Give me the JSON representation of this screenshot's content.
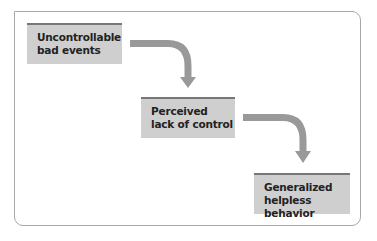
{
  "diagram": {
    "type": "flowchart",
    "colors": {
      "box_fill": "#cfcfcf",
      "box_top_border": "#777777",
      "arrow": "#999999",
      "frame": "#a8a8a8"
    },
    "nodes": [
      {
        "id": "n1",
        "line1": "Uncontrollable",
        "line2": "bad events"
      },
      {
        "id": "n2",
        "line1": "Perceived",
        "line2": "lack of control"
      },
      {
        "id": "n3",
        "line1": "Generalized",
        "line2": "helpless behavior"
      }
    ],
    "edges": [
      {
        "from": "n1",
        "to": "n2",
        "icon": "curved-arrow-down"
      },
      {
        "from": "n2",
        "to": "n3",
        "icon": "curved-arrow-down"
      }
    ]
  }
}
